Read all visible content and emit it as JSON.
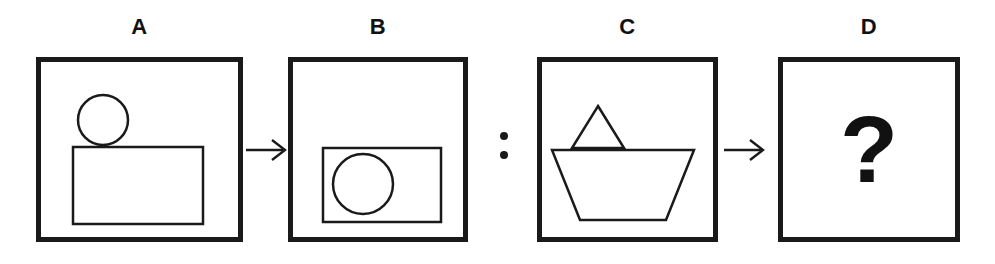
{
  "canvas": {
    "width": 995,
    "height": 264,
    "background": "#ffffff",
    "stroke_color": "#1a1a1a",
    "title": "Visual analogy puzzle: A is to B as C is to ?"
  },
  "panels": [
    {
      "id": "A",
      "label": "A",
      "x": 36,
      "width": 207,
      "height": 185,
      "shapes": [
        {
          "name": "circle",
          "kind": "circle",
          "cx": 62,
          "cy": 58,
          "r": 25,
          "position": "upper-center",
          "fill": "none",
          "stroke": "#1a1a1a",
          "stroke_width": 2.5
        },
        {
          "name": "rectangle",
          "kind": "rect",
          "x": 32,
          "y": 85,
          "width": 130,
          "height": 77,
          "position": "lower-center",
          "fill": "none",
          "stroke": "#1a1a1a",
          "stroke_width": 2.5
        }
      ],
      "description": "A small circle sits above a larger rectangle; the two shapes are separate and merely touch."
    },
    {
      "id": "B",
      "label": "B",
      "x": 288,
      "width": 180,
      "height": 185,
      "shapes": [
        {
          "name": "rectangle",
          "kind": "rect",
          "x": 30,
          "y": 86,
          "width": 118,
          "height": 74,
          "position": "lower-center",
          "fill": "none",
          "stroke": "#1a1a1a",
          "stroke_width": 2.5
        },
        {
          "name": "circle",
          "kind": "circle",
          "cx": 70,
          "cy": 122,
          "r": 30,
          "position": "inside-rectangle",
          "fill": "none",
          "stroke": "#1a1a1a",
          "stroke_width": 2.5
        }
      ],
      "description": "The circle has moved down inside the rectangle, overlapping it."
    },
    {
      "id": "C",
      "label": "C",
      "x": 537,
      "width": 181,
      "height": 185,
      "shapes": [
        {
          "name": "triangle",
          "kind": "polygon",
          "points": "56,44 82,86 30,86",
          "position": "upper-center",
          "fill": "none",
          "stroke": "#1a1a1a",
          "stroke_width": 2.5
        },
        {
          "name": "trapezoid",
          "kind": "polygon",
          "points": "10,88 152,88 124,158 38,158",
          "position": "lower-center",
          "fill": "none",
          "stroke": "#1a1a1a",
          "stroke_width": 2.5
        }
      ],
      "description": "A small triangle sits above a wide downward-tapering trapezoid; the two shapes are separate and merely touch."
    },
    {
      "id": "D",
      "label": "D",
      "x": 778,
      "width": 182,
      "height": 185,
      "shapes": [
        {
          "name": "question-mark",
          "kind": "text",
          "text": "?",
          "position": "center",
          "fill": "#111111"
        }
      ],
      "description": "Unknown answer panel containing a large bold question mark."
    }
  ],
  "connectors": [
    {
      "id": "arrow-a-to-b",
      "kind": "arrow",
      "glyph": "→",
      "x": 245,
      "y": 133,
      "direction": "right"
    },
    {
      "id": "colon-b-to-c",
      "kind": "colon",
      "glyph": ":",
      "x": 497,
      "y": 128,
      "dots": 2
    },
    {
      "id": "arrow-c-to-d",
      "kind": "arrow",
      "glyph": "→",
      "x": 723,
      "y": 133,
      "direction": "right"
    }
  ]
}
